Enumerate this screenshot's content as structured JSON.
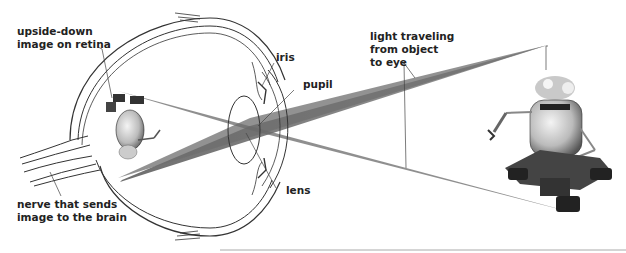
{
  "diagram": {
    "labels": {
      "retina_image": [
        "upside-down",
        "image on retina"
      ],
      "nerve": [
        "nerve that sends",
        "image to the brain"
      ],
      "iris": "iris",
      "pupil": "pupil",
      "lens": "lens",
      "light": [
        "light traveling",
        "from object",
        "to eye"
      ]
    },
    "colors": {
      "light_beam": "#7a7a7a",
      "eye_outline": "#333333",
      "label_text": "#222222",
      "background": "#ffffff"
    },
    "parts": [
      "eyeball",
      "optic nerve",
      "iris",
      "pupil",
      "lens",
      "retina",
      "light rays",
      "robot object",
      "inverted robot image"
    ]
  }
}
